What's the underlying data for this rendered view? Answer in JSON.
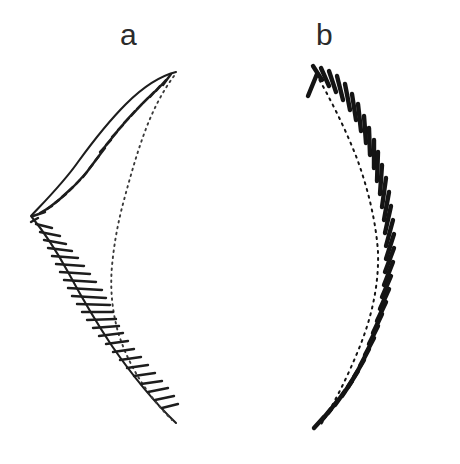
{
  "figure": {
    "title": "",
    "background_color": "#ffffff",
    "ink_color": "#1d1d1d",
    "width": 460,
    "height": 464,
    "panels": [
      {
        "id": "a",
        "label": "a",
        "label_x": 133,
        "label_y": 38,
        "description": "hatched crescent profile drawing",
        "rendering": "line-drawing",
        "outer_outline_style": "solid",
        "inner_outline_style": "dotted",
        "hatch_count": 46,
        "bbox": [
          28,
          66,
          182,
          428
        ],
        "outer_path": "M176,72 C160,76 142,88 126,104 C110,120 94,140 78,162 C64,182 48,198 31,216 C44,232 56,250 68,272 C82,298 96,322 112,346 C130,372 152,400 176,423",
        "inner_path": "M174,76 C162,92 152,112 144,134 C136,156 130,178 124,200 C118,222 114,244 112,266 C110,288 112,310 118,332 C126,358 142,390 172,420",
        "hatches": [
          [
            171,
            74,
            163,
            85
          ],
          [
            166,
            80,
            156,
            91
          ],
          [
            160,
            86,
            150,
            97
          ],
          [
            154,
            92,
            143,
            103
          ],
          [
            148,
            98,
            137,
            109
          ],
          [
            142,
            104,
            131,
            116
          ],
          [
            135,
            111,
            124,
            123
          ],
          [
            129,
            118,
            118,
            130
          ],
          [
            123,
            125,
            112,
            137
          ],
          [
            117,
            132,
            106,
            145
          ],
          [
            111,
            140,
            100,
            152
          ],
          [
            105,
            148,
            95,
            161
          ],
          [
            99,
            156,
            89,
            169
          ],
          [
            93,
            164,
            83,
            177
          ],
          [
            87,
            172,
            76,
            184
          ],
          [
            80,
            180,
            69,
            191
          ],
          [
            73,
            187,
            62,
            197
          ],
          [
            66,
            194,
            55,
            203
          ],
          [
            59,
            200,
            47,
            209
          ],
          [
            52,
            206,
            40,
            213
          ],
          [
            45,
            212,
            33,
            216
          ],
          [
            38,
            218,
            31,
            222
          ],
          [
            36,
            224,
            52,
            228
          ],
          [
            40,
            232,
            60,
            236
          ],
          [
            44,
            240,
            66,
            244
          ],
          [
            48,
            248,
            72,
            251
          ],
          [
            52,
            256,
            78,
            258
          ],
          [
            56,
            264,
            84,
            266
          ],
          [
            60,
            272,
            90,
            274
          ],
          [
            64,
            280,
            96,
            282
          ],
          [
            68,
            288,
            102,
            290
          ],
          [
            72,
            296,
            106,
            298
          ],
          [
            77,
            304,
            110,
            305
          ],
          [
            82,
            312,
            113,
            312
          ],
          [
            87,
            320,
            116,
            319
          ],
          [
            93,
            328,
            119,
            326
          ],
          [
            99,
            336,
            123,
            333
          ],
          [
            106,
            344,
            128,
            341
          ],
          [
            113,
            352,
            134,
            349
          ],
          [
            120,
            360,
            141,
            357
          ],
          [
            127,
            368,
            148,
            365
          ],
          [
            134,
            376,
            155,
            373
          ],
          [
            141,
            384,
            162,
            381
          ],
          [
            148,
            392,
            168,
            388
          ],
          [
            155,
            400,
            174,
            396
          ],
          [
            162,
            408,
            178,
            404
          ]
        ]
      },
      {
        "id": "b",
        "label": "b",
        "label_x": 328,
        "label_y": 38,
        "description": "comb-like arc with radiating teeth",
        "rendering": "line-drawing",
        "spine_style": "dotted",
        "tooth_count": 34,
        "bbox": [
          306,
          66,
          430,
          432
        ],
        "spine_path": "M316,74 C330,98 344,126 356,156 C368,188 376,222 378,252 C379,284 372,316 360,346 C348,376 334,404 320,426",
        "teeth": [
          [
            317,
            74,
            308,
            96
          ],
          [
            322,
            80,
            313,
            66
          ],
          [
            329,
            86,
            321,
            68
          ],
          [
            336,
            92,
            329,
            71
          ],
          [
            343,
            100,
            337,
            76
          ],
          [
            350,
            110,
            345,
            84
          ],
          [
            356,
            120,
            352,
            94
          ],
          [
            361,
            131,
            358,
            104
          ],
          [
            366,
            143,
            364,
            116
          ],
          [
            370,
            155,
            369,
            128
          ],
          [
            374,
            168,
            374,
            140
          ],
          [
            377,
            181,
            378,
            152
          ],
          [
            380,
            194,
            382,
            165
          ],
          [
            382,
            207,
            386,
            178
          ],
          [
            384,
            220,
            389,
            192
          ],
          [
            385,
            233,
            391,
            206
          ],
          [
            386,
            246,
            393,
            220
          ],
          [
            386,
            259,
            394,
            234
          ],
          [
            385,
            272,
            394,
            248
          ],
          [
            384,
            285,
            393,
            262
          ],
          [
            382,
            297,
            391,
            276
          ],
          [
            380,
            309,
            389,
            289
          ],
          [
            377,
            321,
            386,
            302
          ],
          [
            373,
            333,
            382,
            314
          ],
          [
            369,
            344,
            378,
            326
          ],
          [
            365,
            355,
            374,
            338
          ],
          [
            360,
            366,
            369,
            349
          ],
          [
            354,
            377,
            364,
            360
          ],
          [
            348,
            387,
            358,
            371
          ],
          [
            342,
            396,
            352,
            381
          ],
          [
            335,
            405,
            345,
            391
          ],
          [
            328,
            413,
            338,
            400
          ],
          [
            321,
            421,
            331,
            409
          ],
          [
            314,
            428,
            324,
            417
          ]
        ]
      }
    ]
  }
}
